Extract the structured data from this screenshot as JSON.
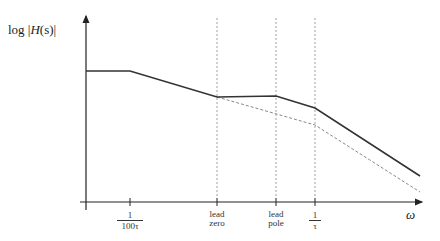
{
  "diagram": {
    "type": "bode-magnitude-asymptotes",
    "y_axis_label": {
      "prefix": "log |",
      "fn": "H",
      "arg": "(s)",
      "suffix": "|"
    },
    "x_axis_label": "ω",
    "ticks": [
      {
        "id": "t1",
        "x": 130,
        "numerator": "1",
        "denominator": "100τ"
      },
      {
        "id": "t2",
        "x": 217,
        "line1": "lead",
        "line2": "zero"
      },
      {
        "id": "t3",
        "x": 276,
        "line1": "lead",
        "line2": "pole"
      },
      {
        "id": "t4",
        "x": 315,
        "numerator": "1",
        "denominator": "τ"
      }
    ],
    "solid_curve": [
      [
        86,
        71
      ],
      [
        130,
        71
      ],
      [
        217,
        97
      ],
      [
        276,
        96
      ],
      [
        315,
        108
      ],
      [
        420,
        176
      ]
    ],
    "dashed_curve": [
      [
        217,
        97
      ],
      [
        315,
        125
      ],
      [
        420,
        192
      ]
    ],
    "colors": {
      "axis": "#222222",
      "curve": "#333333",
      "dashed": "#888888"
    }
  }
}
